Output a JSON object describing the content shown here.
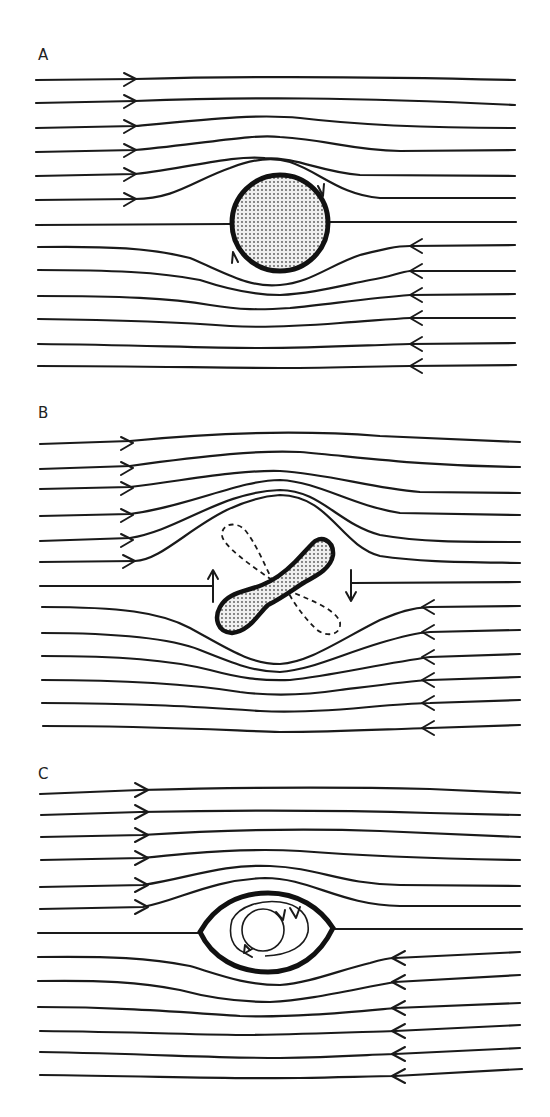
{
  "figure": {
    "colors": {
      "ink": "#1a1a1a",
      "fill": "#d8d8d8",
      "background": "#ffffff"
    }
  },
  "panels": [
    {
      "label": "A",
      "body": "circle",
      "body_note": "rigid sphere with rotation arrows"
    },
    {
      "label": "B",
      "body": "dumbbell",
      "body_note": "rotating elongated particle with dashed alternate orientations and rotation arrows"
    },
    {
      "label": "C",
      "body": "lens-shaped drop",
      "body_note": "deformed drop with internal circulating streamlines"
    }
  ]
}
